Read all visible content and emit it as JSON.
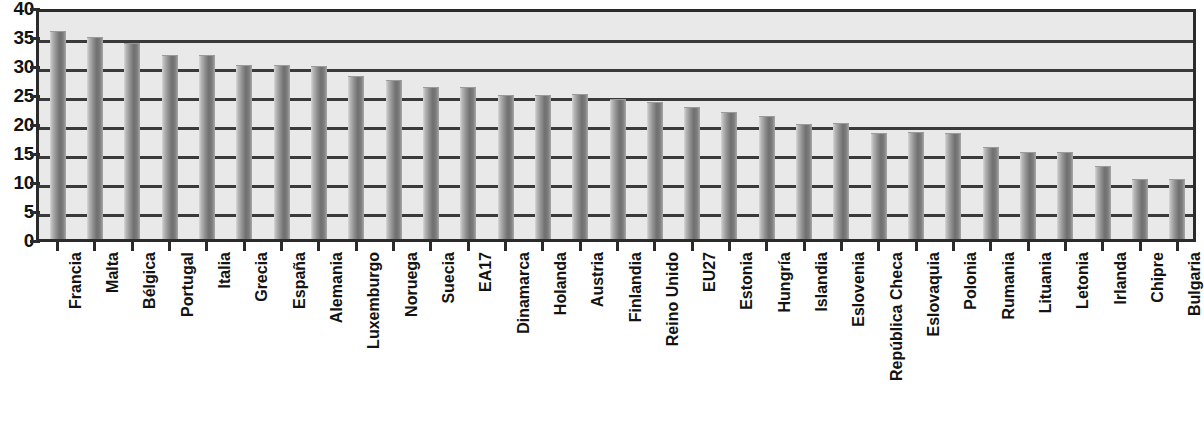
{
  "chart_data": {
    "type": "bar",
    "title": "",
    "xlabel": "",
    "ylabel": "",
    "ylim": [
      0,
      40
    ],
    "yticks": [
      0,
      5,
      10,
      15,
      20,
      25,
      30,
      35,
      40
    ],
    "ytick_labels": [
      "0",
      "5",
      "10",
      "15",
      "20",
      "25",
      "30",
      "35",
      "40"
    ],
    "grid": true,
    "legend": "none",
    "bar_color": "#7d7d7d",
    "plot_background": "#e9e9e9",
    "axis_color": "#2b2b2b",
    "categories": [
      "Francia",
      "Malta",
      "Bélgica",
      "Portugal",
      "Italia",
      "Grecia",
      "España",
      "Alemania",
      "Luxemburgo",
      "Noruega",
      "Suecia",
      "EA17",
      "Dinamarca",
      "Holanda",
      "Austria",
      "Finlandia",
      "Reino Unido",
      "EU27",
      "Estonia",
      "Hungría",
      "Islandia",
      "Eslovenia",
      "República Checa",
      "Eslovaquia",
      "Polonia",
      "Rumania",
      "Lituania",
      "Letonia",
      "Irlanda",
      "Chipre",
      "Bulgaria"
    ],
    "values": [
      36.2,
      35.2,
      34.1,
      32.0,
      32.1,
      30.3,
      30.3,
      30.2,
      28.5,
      27.7,
      26.6,
      26.6,
      25.2,
      25.2,
      25.3,
      24.5,
      23.9,
      23.1,
      22.2,
      21.5,
      20.2,
      20.3,
      18.7,
      18.8,
      18.7,
      16.2,
      15.4,
      15.4,
      13.0,
      10.7,
      10.7
    ]
  }
}
